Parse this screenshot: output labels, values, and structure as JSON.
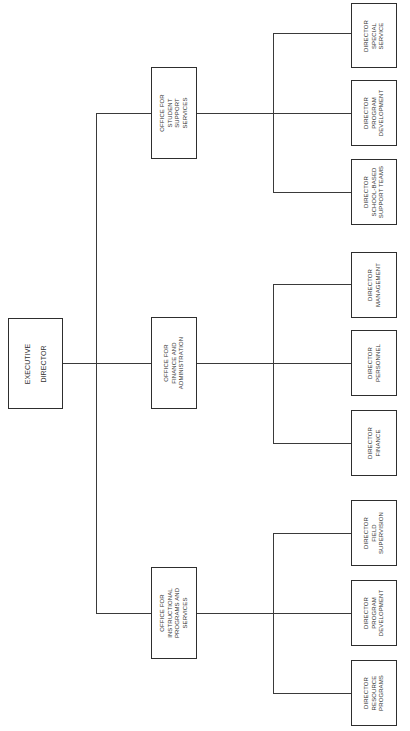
{
  "chart": {
    "root": {
      "lines": [
        "EXECUTIVE",
        "DIRECTOR"
      ]
    },
    "offices": [
      {
        "name": "student-support",
        "lines": [
          "OFFICE FOR",
          "STUDENT",
          "SUPPORT",
          "SERVICES"
        ],
        "children": [
          {
            "lines": [
              "DIRECTOR",
              "SPECIAL",
              "SERVICE"
            ]
          },
          {
            "lines": [
              "DIRECTOR",
              "PROGRAM",
              "DEVELOPMENT"
            ]
          },
          {
            "lines": [
              "DIRECTOR",
              "SCHOOL-BASED",
              "SUPPORT TEAMS"
            ]
          }
        ]
      },
      {
        "name": "finance-administration",
        "lines": [
          "OFFICE FOR",
          "FINANCE AND",
          "ADMINISTRATION"
        ],
        "children": [
          {
            "lines": [
              "DIRECTOR",
              "MANAGEMENT"
            ]
          },
          {
            "lines": [
              "DIRECTOR",
              "PERSONNEL"
            ]
          },
          {
            "lines": [
              "DIRECTOR",
              "FINANCE"
            ]
          }
        ]
      },
      {
        "name": "instructional-programs",
        "lines": [
          "OFFICE FOR",
          "INSTRUCTIONAL",
          "PROGRAMS AND",
          "SERVICES"
        ],
        "children": [
          {
            "lines": [
              "DIRECTOR",
              "FIELD",
              "SUPERVISION"
            ]
          },
          {
            "lines": [
              "DIRECTOR",
              "PROGRAM",
              "DEVELOPMENT"
            ]
          },
          {
            "lines": [
              "DIRECTOR",
              "RESOURCE",
              "PROGRAMS"
            ]
          }
        ]
      }
    ]
  }
}
